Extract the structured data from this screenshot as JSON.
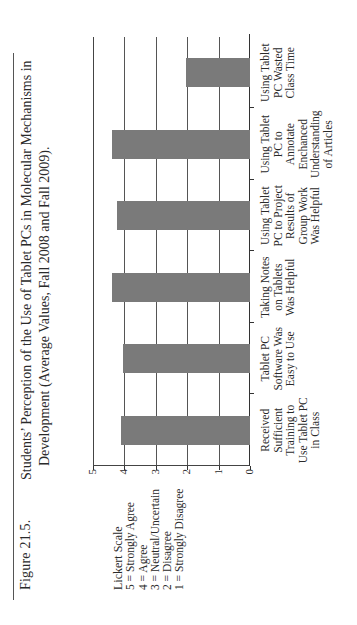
{
  "figure": {
    "label": "Figure 21.5.",
    "title_line1": "Students’ Perception of the Use of Tablet PCs in Molecular Mechanisms in",
    "title_line2": "Development (Average Values, Fall 2008 and Fall 2009)."
  },
  "legend": {
    "title": "Lickert Scale",
    "items": [
      "5 = Strongly Agree",
      "4 = Agree",
      "3 = Neutral/Uncertain",
      "2 = Disagree",
      "1 = Strongly Disagree"
    ]
  },
  "colors": {
    "bar": "#7a7a7a",
    "grid": "#555555",
    "text": "#2a2a2a"
  },
  "chart_data": {
    "type": "bar",
    "orientation": "vertical (page rotated 90° counter-clockwise)",
    "title": "Students’ Perception of the Use of Tablet PCs in Molecular Mechanisms in Development (Average Values, Fall 2008 and Fall 2009).",
    "xlabel": "",
    "ylabel": "",
    "ylim": [
      0,
      5
    ],
    "yticks": [
      "0",
      "1",
      "2",
      "3",
      "4",
      "5"
    ],
    "grid": true,
    "legend_position": "left (text box: Lickert Scale)",
    "categories": [
      "Received Sufficient Training to Use Tablet PC in Class",
      "Tablet PC Software Was Easy to Use",
      "Taking Notes on Tablets Was Helpful",
      "Using Tablet PC to Project Results of Group Work Was Helpful",
      "Using Tablet PC to Annotate Enchanced Understanding of Articles",
      "Using Tablet PC Wasted Class Time"
    ],
    "category_lines": [
      [
        "Received",
        "Sufficient",
        "Training to",
        "Use Tablet PC",
        "in Class"
      ],
      [
        "Tablet PC",
        "Software Was",
        "Easy to Use"
      ],
      [
        "Taking Notes",
        "on Tablets",
        "Was Helpful"
      ],
      [
        "Using Tablet",
        "PC to Project",
        "Results of",
        "Group Work",
        "Was Helpful"
      ],
      [
        "Using Tablet",
        "PC to",
        "Annotate",
        "Enchanced",
        "Understanding",
        "of Articles"
      ],
      [
        "Using Tablet",
        "PC Wasted",
        "Class Time"
      ]
    ],
    "values": [
      4.1,
      4.05,
      4.4,
      4.25,
      4.4,
      2.05
    ]
  }
}
